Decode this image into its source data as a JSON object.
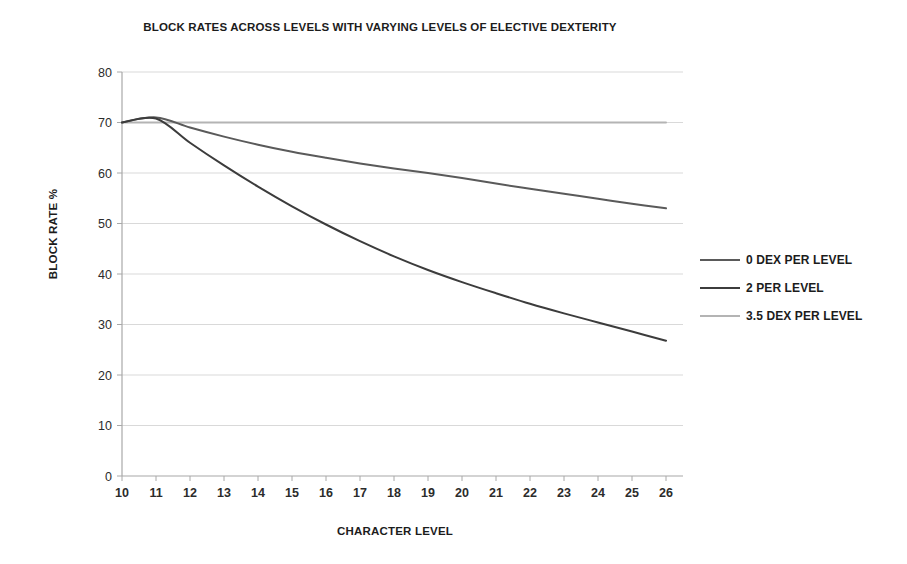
{
  "chart_data": {
    "type": "line",
    "title": "BLOCK RATES ACROSS LEVELS  WITH VARYING LEVELS OF ELECTIVE DEXTERITY",
    "xlabel": "CHARACTER LEVEL",
    "ylabel": "BLOCK RATE %",
    "xlim": [
      10,
      26
    ],
    "ylim": [
      0,
      80
    ],
    "ytick_step": 10,
    "grid": true,
    "legend_position": "right",
    "x": [
      10,
      11,
      12,
      13,
      14,
      15,
      16,
      17,
      18,
      19,
      20,
      21,
      22,
      23,
      24,
      25,
      26
    ],
    "xticklabels": [
      "10",
      "11",
      "12",
      "13",
      "14",
      "15",
      "16",
      "17",
      "18",
      "19",
      "20",
      "21",
      "22",
      "23",
      "24",
      "25",
      "26"
    ],
    "yticklabels": [
      "0",
      "10",
      "20",
      "30",
      "40",
      "50",
      "60",
      "70",
      "80"
    ],
    "series": [
      {
        "name": "0 DEX PER LEVEL",
        "color": "#5a5a5a",
        "values": [
          70.0,
          71.0,
          69.0,
          67.2,
          65.6,
          64.2,
          63.0,
          61.9,
          60.9,
          60.0,
          59.0,
          57.9,
          56.9,
          55.9,
          54.9,
          53.9,
          53.0
        ]
      },
      {
        "name": "2 PER LEVEL",
        "color": "#3c3c3c",
        "values": [
          70.0,
          70.8,
          66.0,
          61.5,
          57.3,
          53.4,
          49.8,
          46.5,
          43.5,
          40.8,
          38.4,
          36.2,
          34.1,
          32.2,
          30.4,
          28.6,
          26.8
        ]
      },
      {
        "name": "3.5 DEX PER LEVEL",
        "color": "#b4b4b4",
        "values": [
          70.0,
          70.0,
          70.0,
          70.0,
          70.0,
          70.0,
          70.0,
          70.0,
          70.0,
          70.0,
          70.0,
          70.0,
          70.0,
          70.0,
          70.0,
          70.0,
          70.0
        ]
      }
    ]
  },
  "style": {
    "grid_color": "#d9d9d9",
    "axis_color": "#a8a8a8",
    "text_color": "#1c1c1c",
    "background": "#ffffff"
  }
}
